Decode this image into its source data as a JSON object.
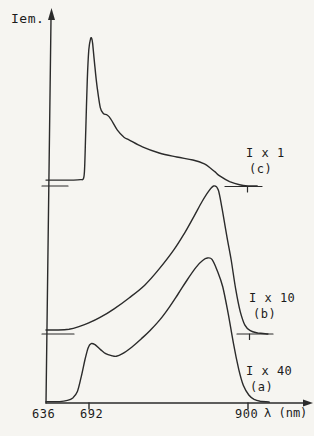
{
  "labels": {
    "ylabel": "Iem.",
    "xlabel": "λ (nm)",
    "tick_636": "636",
    "tick_692": "692",
    "tick_900": "900"
  },
  "chart_data": {
    "type": "line",
    "title": "",
    "xlabel": "λ (nm)",
    "ylabel": "Iem.",
    "x_axis": {
      "min": 636,
      "max": 900,
      "ticks": [
        636,
        692,
        900
      ],
      "unit": "nm"
    },
    "y_axis": {
      "label": "Iem.",
      "arrow": true,
      "scale": "arbitrary intensity, curves vertically offset"
    },
    "legend_position": "right-of-each-curve",
    "grid": false,
    "series": [
      {
        "name": "(c)",
        "gain_label": "I x 1",
        "points": [
          [
            636,
            0.04
          ],
          [
            655,
            0.04
          ],
          [
            672,
            0.04
          ],
          [
            681,
            0.043
          ],
          [
            685,
            0.05
          ],
          [
            686.5,
            0.12
          ],
          [
            688,
            0.38
          ],
          [
            690,
            0.72
          ],
          [
            692,
            0.92
          ],
          [
            694,
            0.99
          ],
          [
            695.5,
            1.0
          ],
          [
            697,
            0.96
          ],
          [
            700,
            0.8
          ],
          [
            703,
            0.66
          ],
          [
            707,
            0.53
          ],
          [
            711,
            0.49
          ],
          [
            716,
            0.48
          ],
          [
            721,
            0.45
          ],
          [
            729,
            0.38
          ],
          [
            738,
            0.33
          ],
          [
            745,
            0.31
          ],
          [
            762,
            0.264
          ],
          [
            784,
            0.223
          ],
          [
            807,
            0.196
          ],
          [
            828,
            0.176
          ],
          [
            843,
            0.15
          ],
          [
            850,
            0.125
          ],
          [
            857,
            0.095
          ],
          [
            863,
            0.068
          ],
          [
            876,
            0.03
          ],
          [
            889,
            0.008
          ],
          [
            900,
            0.001
          ],
          [
            912,
            0
          ]
        ]
      },
      {
        "name": "(b)",
        "gain_label": "I x 10",
        "points": [
          [
            636,
            0.027
          ],
          [
            652,
            0.027
          ],
          [
            666,
            0.032
          ],
          [
            679,
            0.05
          ],
          [
            692,
            0.075
          ],
          [
            706,
            0.11
          ],
          [
            725,
            0.17
          ],
          [
            745,
            0.245
          ],
          [
            765,
            0.33
          ],
          [
            784,
            0.44
          ],
          [
            804,
            0.575
          ],
          [
            818,
            0.69
          ],
          [
            830,
            0.8
          ],
          [
            840,
            0.895
          ],
          [
            848,
            0.96
          ],
          [
            855,
            1.0
          ],
          [
            861,
            0.975
          ],
          [
            866,
            0.85
          ],
          [
            872,
            0.67
          ],
          [
            878,
            0.5
          ],
          [
            884,
            0.3
          ],
          [
            890,
            0.15
          ],
          [
            896,
            0.06
          ],
          [
            903,
            0.022
          ],
          [
            913,
            0.007
          ],
          [
            926,
            0
          ]
        ]
      },
      {
        "name": "(a)",
        "gain_label": "I x 40",
        "points": [
          [
            636,
            0.01
          ],
          [
            654,
            0.01
          ],
          [
            664,
            0.018
          ],
          [
            671,
            0.035
          ],
          [
            677,
            0.08
          ],
          [
            682,
            0.18
          ],
          [
            687,
            0.3
          ],
          [
            691,
            0.38
          ],
          [
            695,
            0.41
          ],
          [
            700,
            0.402
          ],
          [
            707,
            0.37
          ],
          [
            714,
            0.34
          ],
          [
            722,
            0.326
          ],
          [
            728,
            0.322
          ],
          [
            736,
            0.34
          ],
          [
            748,
            0.385
          ],
          [
            760,
            0.44
          ],
          [
            772,
            0.5
          ],
          [
            785,
            0.575
          ],
          [
            797,
            0.66
          ],
          [
            809,
            0.755
          ],
          [
            820,
            0.845
          ],
          [
            832,
            0.935
          ],
          [
            841,
            0.985
          ],
          [
            847,
            1.0
          ],
          [
            853,
            0.99
          ],
          [
            860,
            0.91
          ],
          [
            867,
            0.8
          ],
          [
            874,
            0.62
          ],
          [
            881,
            0.41
          ],
          [
            888,
            0.23
          ],
          [
            894,
            0.12
          ],
          [
            901,
            0.055
          ],
          [
            908,
            0.025
          ],
          [
            916,
            0.012
          ],
          [
            928,
            0.006
          ]
        ]
      }
    ],
    "layout": {
      "width": 314,
      "height": 436,
      "line_color": "#2b2b2b",
      "line_width": 1.4,
      "background": "#f6f5f1",
      "px": {
        "x_origin": 46,
        "x_at_900": 248,
        "axis_y": 403,
        "axis_top_x": 51,
        "axis_top_y": 19,
        "y_arrow_tip_y": 8,
        "x_axis_end": 304,
        "x_arrow_tip": 313,
        "tick_len": 6,
        "x_ticks_px": [
          89,
          248
        ],
        "series_px": [
          {
            "zero_y": 186,
            "amplitude": 148
          },
          {
            "zero_y": 334,
            "amplitude": 148
          },
          {
            "zero_y": 403,
            "amplitude": 145
          }
        ],
        "zero_dashes": [
          {
            "y": 186,
            "x1": 42,
            "x2": 68
          },
          {
            "y": 334,
            "x1": 42,
            "x2": 74
          },
          {
            "y": 186.5,
            "x1": 225,
            "x2": 262,
            "tick_x": 247.5
          },
          {
            "y": 334,
            "x1": 237,
            "x2": 273,
            "tick_x": 249.5
          }
        ]
      }
    }
  }
}
